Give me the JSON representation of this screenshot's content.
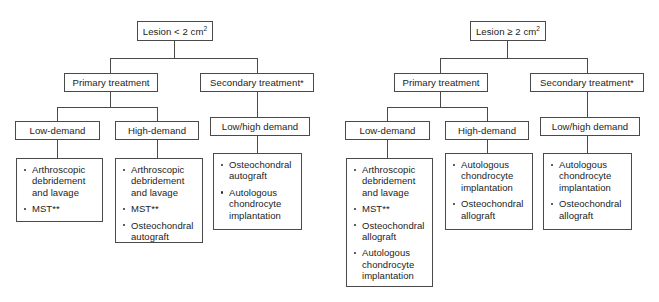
{
  "diagram": {
    "trees": [
      {
        "id": "lesion-small",
        "root": {
          "label_prefix": "Lesion < 2 cm",
          "label_sup": "2"
        },
        "branches": [
          {
            "id": "primary",
            "label": "Primary treatment",
            "children": [
              {
                "id": "low-demand",
                "label": "Low-demand",
                "items": [
                  "Arthroscopic debridement and lavage",
                  "MST**"
                ]
              },
              {
                "id": "high-demand",
                "label": "High-demand",
                "items": [
                  "Arthroscopic debridement and lavage",
                  "MST**",
                  "Osteochondral autograft"
                ]
              }
            ]
          },
          {
            "id": "secondary",
            "label": "Secondary treatment*",
            "children": [
              {
                "id": "low-high-demand",
                "label": "Low/high demand",
                "items": [
                  "Osteochondral autograft",
                  "Autologous chondrocyte implantation"
                ]
              }
            ]
          }
        ]
      },
      {
        "id": "lesion-large",
        "root": {
          "label_prefix": "Lesion ≥ 2 cm",
          "label_sup": "2"
        },
        "branches": [
          {
            "id": "primary",
            "label": "Primary treatment",
            "children": [
              {
                "id": "low-demand",
                "label": "Low-demand",
                "items": [
                  "Arthroscopic debridement and lavage",
                  "MST**",
                  "Osteochondral allograft",
                  "Autologous chondrocyte implantation"
                ]
              },
              {
                "id": "high-demand",
                "label": "High-demand",
                "items": [
                  "Autologous chondrocyte implantation",
                  "Osteochondral allograft"
                ]
              }
            ]
          },
          {
            "id": "secondary",
            "label": "Secondary treatment*",
            "children": [
              {
                "id": "low-high-demand",
                "label": "Low/high demand",
                "items": [
                  "Autologous chondrocyte implantation",
                  "Osteochondral allograft"
                ]
              }
            ]
          }
        ]
      }
    ],
    "colors": {
      "border": "#4a4a4a",
      "text": "#1c1c1c",
      "background": "#ffffff"
    }
  }
}
